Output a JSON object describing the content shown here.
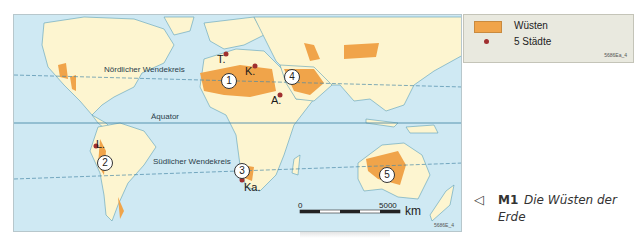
{
  "map": {
    "colors": {
      "ocean": "#cfe9f3",
      "land": "#fdf5d0",
      "desert": "#f0a44a",
      "city": "#a03030",
      "coast": "#5a9fb8",
      "latitude_line": "#4a8aa8"
    },
    "latitude_labels": {
      "north_tropic": "Nördlicher Wendekreis",
      "equator": "Äquator",
      "south_tropic": "Südlicher Wendekreis"
    },
    "cities": [
      {
        "label": "T.",
        "x": 226,
        "y": 28
      },
      {
        "label": "K.",
        "x": 254,
        "y": 65
      },
      {
        "label": "A.",
        "x": 280,
        "y": 95
      },
      {
        "label": "L.",
        "x": 95,
        "y": 145
      },
      {
        "label": "Ka.",
        "x": 242,
        "y": 180
      }
    ],
    "desert_numbers": [
      "1",
      "2",
      "3",
      "4",
      "5"
    ],
    "scale": {
      "start": "0",
      "end": "5000",
      "unit": "km"
    },
    "code": "5686E_4"
  },
  "legend": {
    "items": [
      {
        "label": "Wüsten",
        "symbol": "desert-swatch"
      },
      {
        "label": "5 Städte",
        "symbol": "city-dot"
      }
    ],
    "code": "5686Ea_4"
  },
  "caption": {
    "pointer": "◁",
    "number": "M1",
    "title_line1": "Die Wüsten der",
    "title_line2": "Erde"
  }
}
